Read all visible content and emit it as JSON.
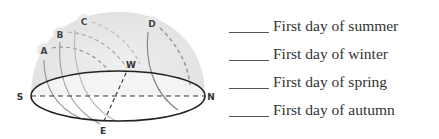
{
  "diagram": {
    "directions": {
      "south": "S",
      "north": "N",
      "west": "W",
      "east": "E"
    },
    "sun_paths": [
      {
        "label": "A"
      },
      {
        "label": "B"
      },
      {
        "label": "C"
      },
      {
        "label": "D"
      }
    ]
  },
  "answers": {
    "items": [
      {
        "blank": "",
        "text": "First day of summer"
      },
      {
        "blank": "",
        "text": "First day of winter"
      },
      {
        "blank": "",
        "text": "First day of spring"
      },
      {
        "blank": "",
        "text": "First day of autumn"
      }
    ]
  }
}
